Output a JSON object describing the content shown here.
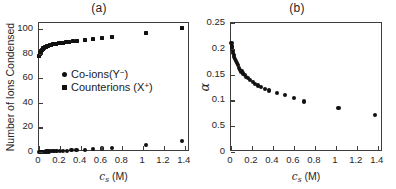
{
  "figure": {
    "panel_a_title": "(a)",
    "panel_b_title": "(b)"
  },
  "panel_a": {
    "xlabel_main": "c",
    "xlabel_sub": "s",
    "xlabel_unit": " (M)",
    "ylabel": "Number of Ions Condensed",
    "xticks": [
      "0",
      "0.2",
      "0.4",
      "0.6",
      "0.8",
      "1",
      "1.2",
      "1.4"
    ],
    "yticks": [
      "0",
      "20",
      "40",
      "60",
      "80",
      "100"
    ],
    "legend": [
      {
        "marker": "circle",
        "label_main": "Co-ions(Y",
        "label_sup": "−",
        "label_end": ")"
      },
      {
        "marker": "square",
        "label_main": "Counterions (X",
        "label_sup": "+",
        "label_end": ")"
      }
    ]
  },
  "panel_b": {
    "xlabel_main": "c",
    "xlabel_sub": "s",
    "xlabel_unit": " (M)",
    "ylabel": "α",
    "xticks": [
      "0",
      "0.2",
      "0.4",
      "0.6",
      "0.8",
      "1",
      "1.2",
      "1.4"
    ],
    "yticks": [
      "0",
      "0.5",
      "0.1",
      "0.15",
      "0.2",
      "0.25"
    ]
  },
  "chart_data": [
    {
      "type": "scatter",
      "panel": "(a)",
      "title": "(a)",
      "xlabel": "c_s (M)",
      "ylabel": "Number of Ions Condensed",
      "xlim": [
        0,
        1.45
      ],
      "ylim": [
        0,
        105
      ],
      "xticks": [
        0,
        0.2,
        0.4,
        0.6,
        0.8,
        1.0,
        1.2,
        1.4
      ],
      "yticks": [
        0,
        20,
        40,
        60,
        80,
        100
      ],
      "grid": false,
      "legend_position": "center-left",
      "series": [
        {
          "name": "Counterions (X+)",
          "marker": "square",
          "color": "#111111",
          "points": [
            [
              0.004,
              78.0
            ],
            [
              0.008,
              79.6
            ],
            [
              0.012,
              80.8
            ],
            [
              0.017,
              81.8
            ],
            [
              0.022,
              82.5
            ],
            [
              0.028,
              83.2
            ],
            [
              0.034,
              83.8
            ],
            [
              0.041,
              84.3
            ],
            [
              0.049,
              84.8
            ],
            [
              0.058,
              85.3
            ],
            [
              0.068,
              85.7
            ],
            [
              0.079,
              86.1
            ],
            [
              0.091,
              86.5
            ],
            [
              0.104,
              86.9
            ],
            [
              0.118,
              87.2
            ],
            [
              0.133,
              87.6
            ],
            [
              0.15,
              87.9
            ],
            [
              0.168,
              88.2
            ],
            [
              0.188,
              88.5
            ],
            [
              0.21,
              88.8
            ],
            [
              0.234,
              89.1
            ],
            [
              0.26,
              89.4
            ],
            [
              0.29,
              89.7
            ],
            [
              0.325,
              90.0
            ],
            [
              0.365,
              90.4
            ],
            [
              0.438,
              91.0
            ],
            [
              0.516,
              91.7
            ],
            [
              0.604,
              92.5
            ],
            [
              0.7,
              93.6
            ],
            [
              1.025,
              97.0
            ],
            [
              1.37,
              101.0
            ]
          ]
        },
        {
          "name": "Co-ions(Y-)",
          "marker": "circle",
          "color": "#111111",
          "points": [
            [
              0.004,
              0.1
            ],
            [
              0.01,
              0.1
            ],
            [
              0.018,
              0.15
            ],
            [
              0.028,
              0.2
            ],
            [
              0.04,
              0.25
            ],
            [
              0.055,
              0.3
            ],
            [
              0.072,
              0.35
            ],
            [
              0.092,
              0.4
            ],
            [
              0.115,
              0.5
            ],
            [
              0.14,
              0.6
            ],
            [
              0.168,
              0.7
            ],
            [
              0.198,
              0.8
            ],
            [
              0.232,
              0.95
            ],
            [
              0.27,
              1.1
            ],
            [
              0.312,
              1.3
            ],
            [
              0.36,
              1.5
            ],
            [
              0.438,
              1.9
            ],
            [
              0.516,
              2.3
            ],
            [
              0.604,
              2.8
            ],
            [
              0.7,
              3.4
            ],
            [
              1.025,
              5.8
            ],
            [
              1.37,
              8.8
            ]
          ]
        }
      ]
    },
    {
      "type": "scatter",
      "panel": "(b)",
      "title": "(b)",
      "xlabel": "c_s (M)",
      "ylabel": "α",
      "xlim": [
        0,
        1.45
      ],
      "ylim": [
        0,
        0.25
      ],
      "xticks": [
        0,
        0.2,
        0.4,
        0.6,
        0.8,
        1.0,
        1.2,
        1.4
      ],
      "yticks": [
        0,
        0.05,
        0.1,
        0.15,
        0.2,
        0.25
      ],
      "ytick_labels": [
        "0",
        "0.5",
        "0.1",
        "0.15",
        "0.2",
        "0.25"
      ],
      "grid": false,
      "legend_position": "none",
      "series": [
        {
          "name": "alpha",
          "marker": "circle",
          "color": "#111111",
          "points": [
            [
              0.004,
              0.212
            ],
            [
              0.006,
              0.206
            ],
            [
              0.009,
              0.203
            ],
            [
              0.012,
              0.199
            ],
            [
              0.016,
              0.196
            ],
            [
              0.02,
              0.192
            ],
            [
              0.025,
              0.188
            ],
            [
              0.031,
              0.184
            ],
            [
              0.038,
              0.18
            ],
            [
              0.046,
              0.176
            ],
            [
              0.055,
              0.172
            ],
            [
              0.065,
              0.168
            ],
            [
              0.076,
              0.163
            ],
            [
              0.088,
              0.159
            ],
            [
              0.101,
              0.156
            ],
            [
              0.115,
              0.152
            ],
            [
              0.13,
              0.149
            ],
            [
              0.147,
              0.146
            ],
            [
              0.165,
              0.143
            ],
            [
              0.185,
              0.14
            ],
            [
              0.207,
              0.136
            ],
            [
              0.231,
              0.132
            ],
            [
              0.258,
              0.129
            ],
            [
              0.288,
              0.126
            ],
            [
              0.322,
              0.122
            ],
            [
              0.36,
              0.119
            ],
            [
              0.438,
              0.114
            ],
            [
              0.516,
              0.11
            ],
            [
              0.604,
              0.105
            ],
            [
              0.7,
              0.098
            ],
            [
              1.025,
              0.085
            ],
            [
              1.37,
              0.072
            ]
          ]
        }
      ]
    }
  ]
}
